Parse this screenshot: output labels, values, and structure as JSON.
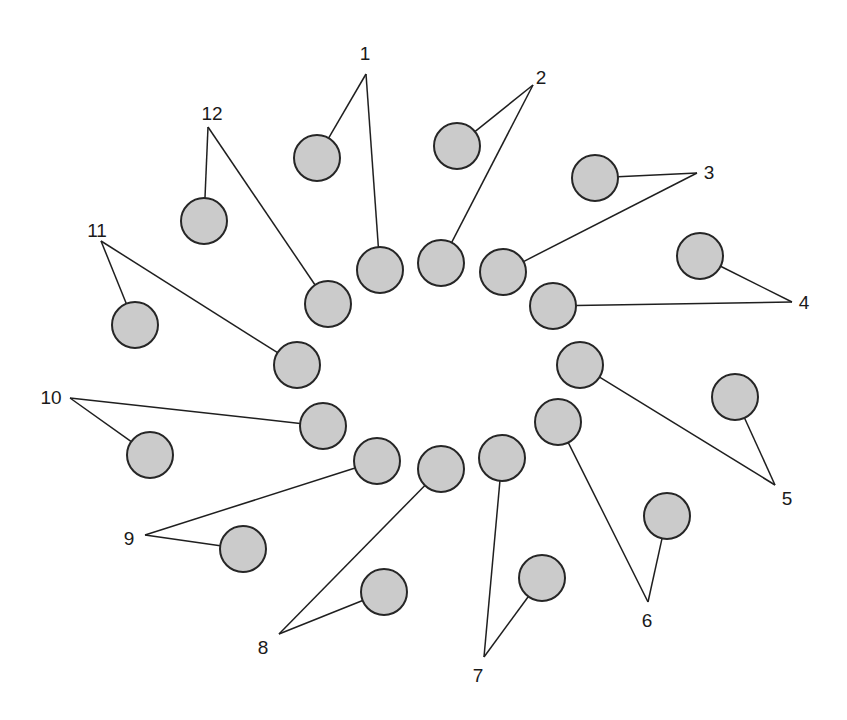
{
  "diagram": {
    "style": {
      "circle_fill": "#cbcbcb",
      "circle_stroke": "#262626",
      "line_color": "#1f1f1f",
      "background": "#ffffff"
    },
    "pairs": [
      {
        "label": "1",
        "label_pos": [
          365,
          53
        ],
        "apex": [
          366,
          74
        ],
        "inner": [
          380,
          270
        ],
        "outer": [
          317,
          158
        ]
      },
      {
        "label": "2",
        "label_pos": [
          541,
          77
        ],
        "apex": [
          533,
          85
        ],
        "inner": [
          441,
          263
        ],
        "outer": [
          457,
          146
        ]
      },
      {
        "label": "3",
        "label_pos": [
          709,
          172
        ],
        "apex": [
          697,
          173
        ],
        "inner": [
          503,
          272
        ],
        "outer": [
          595,
          178
        ]
      },
      {
        "label": "4",
        "label_pos": [
          804,
          302
        ],
        "apex": [
          792,
          302
        ],
        "inner": [
          553,
          306
        ],
        "outer": [
          700,
          256
        ]
      },
      {
        "label": "5",
        "label_pos": [
          787,
          498
        ],
        "apex": [
          775,
          485
        ],
        "inner": [
          580,
          365
        ],
        "outer": [
          735,
          397
        ]
      },
      {
        "label": "6",
        "label_pos": [
          647,
          620
        ],
        "apex": [
          648,
          602
        ],
        "inner": [
          558,
          422
        ],
        "outer": [
          667,
          516
        ]
      },
      {
        "label": "7",
        "label_pos": [
          478,
          675
        ],
        "apex": [
          484,
          657
        ],
        "inner": [
          502,
          458
        ],
        "outer": [
          542,
          578
        ]
      },
      {
        "label": "8",
        "label_pos": [
          263,
          647
        ],
        "apex": [
          279,
          634
        ],
        "inner": [
          441,
          469
        ],
        "outer": [
          384,
          592
        ]
      },
      {
        "label": "9",
        "label_pos": [
          129,
          538
        ],
        "apex": [
          145,
          535
        ],
        "inner": [
          377,
          461
        ],
        "outer": [
          243,
          549
        ]
      },
      {
        "label": "10",
        "label_pos": [
          51,
          397
        ],
        "apex": [
          70,
          398
        ],
        "inner": [
          323,
          426
        ],
        "outer": [
          150,
          455
        ]
      },
      {
        "label": "11",
        "label_pos": [
          97,
          230
        ],
        "apex": [
          101,
          241
        ],
        "inner": [
          297,
          365
        ],
        "outer": [
          135,
          325
        ]
      },
      {
        "label": "12",
        "label_pos": [
          212,
          113
        ],
        "apex": [
          208,
          127
        ],
        "inner": [
          328,
          304
        ],
        "outer": [
          204,
          221
        ]
      }
    ],
    "circle_radius": 23
  }
}
